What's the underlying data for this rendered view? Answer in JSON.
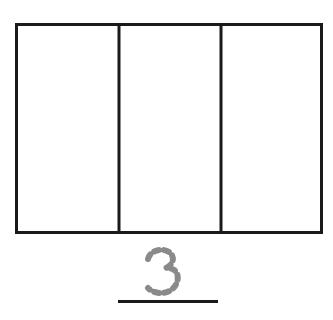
{
  "worksheet": {
    "type": "partitioned-shape-fraction-worksheet",
    "background_color": "#ffffff",
    "width": 333,
    "height": 320
  },
  "figure": {
    "name": "partitioned-rectangle",
    "shape": "rectangle",
    "total_parts": 3,
    "shaded_parts": 0,
    "stroke_color": "#1a1a1a",
    "fill_color": "#ffffff",
    "outer_stroke_width": 3,
    "divider_stroke_width": 3,
    "bounds": {
      "x": 15,
      "y": 23,
      "width": 308,
      "height": 211
    },
    "divider_x_positions": [
      104,
      206
    ],
    "cells": [
      {
        "index": 1,
        "label": "",
        "shaded": false
      },
      {
        "index": 2,
        "label": "",
        "shaded": false
      },
      {
        "index": 3,
        "label": "",
        "shaded": false
      }
    ]
  },
  "numeral": {
    "name": "tracing-numeral-three",
    "value": "3",
    "style": "dotted-trace",
    "stroke_color": "#8a8a8a",
    "stroke_width": 6,
    "dash_pattern": "5 5"
  },
  "answer_line": {
    "name": "answer-underline",
    "color": "#1a1a1a",
    "thickness": 3,
    "width": 100
  },
  "icons": {
    "rectangle_outline": "rectangle-outline-icon",
    "vertical_divider": "vertical-divider-icon",
    "numeral_three_trace": "numeral-three-dotted-icon",
    "horizontal_rule": "horizontal-rule-icon"
  }
}
